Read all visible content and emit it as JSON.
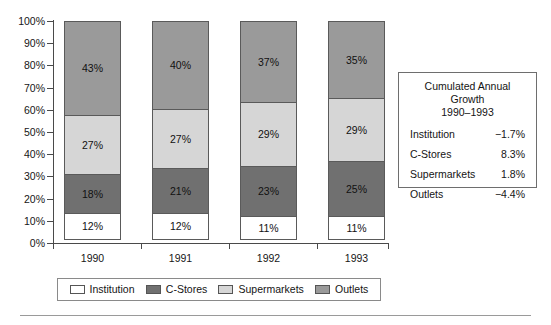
{
  "chart_data": {
    "type": "bar",
    "subtype": "stacked-percentage-column",
    "title": "",
    "xlabel": "",
    "ylabel": "",
    "categories": [
      "1990",
      "1991",
      "1992",
      "1993"
    ],
    "ylim": [
      0,
      100
    ],
    "yticks": [
      "0%",
      "10%",
      "20%",
      "30%",
      "40%",
      "50%",
      "60%",
      "70%",
      "80%",
      "90%",
      "100%"
    ],
    "ytick_values": [
      0,
      10,
      20,
      30,
      40,
      50,
      60,
      70,
      80,
      90,
      100
    ],
    "grid": false,
    "legend_position": "bottom",
    "series": [
      {
        "name": "Institution",
        "color": "#ffffff",
        "values": [
          12,
          12,
          11,
          11
        ],
        "labels": [
          "12%",
          "12%",
          "11%",
          "11%"
        ]
      },
      {
        "name": "C-Stores",
        "color": "#707070",
        "values": [
          18,
          21,
          23,
          25
        ],
        "labels": [
          "18%",
          "21%",
          "23%",
          "25%"
        ]
      },
      {
        "name": "Supermarkets",
        "color": "#d6d6d6",
        "values": [
          27,
          27,
          29,
          29
        ],
        "labels": [
          "27%",
          "27%",
          "29%",
          "29%"
        ]
      },
      {
        "name": "Outlets",
        "color": "#9a9a9a",
        "values": [
          43,
          40,
          37,
          35
        ],
        "labels": [
          "43%",
          "40%",
          "37%",
          "35%"
        ]
      }
    ]
  },
  "legend": {
    "items": [
      {
        "label": "Institution",
        "color": "#ffffff"
      },
      {
        "label": "C-Stores",
        "color": "#707070"
      },
      {
        "label": "Supermarkets",
        "color": "#d6d6d6"
      },
      {
        "label": "Outlets",
        "color": "#9a9a9a"
      }
    ]
  },
  "growth_box": {
    "title_line1": "Cumulated Annual Growth",
    "title_line2": "1990–1993",
    "rows": [
      {
        "label": "Institution",
        "value": "−1.7%"
      },
      {
        "label": "C-Stores",
        "value": "8.3%"
      },
      {
        "label": "Supermarkets",
        "value": "1.8%"
      },
      {
        "label": "Outlets",
        "value": "−4.4%"
      }
    ]
  }
}
